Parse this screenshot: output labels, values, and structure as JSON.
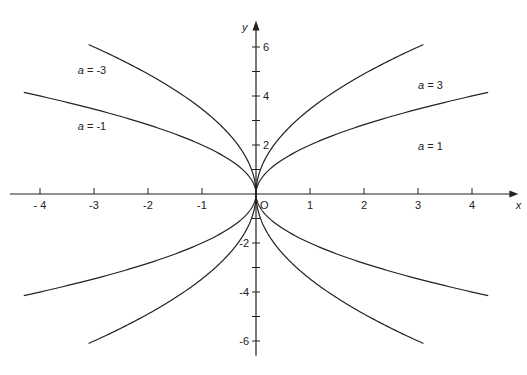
{
  "chart_data": {
    "type": "line",
    "title": "",
    "xlabel": "x",
    "ylabel": "y",
    "origin_label": "O",
    "xlim": [
      -4.5,
      4.6
    ],
    "ylim": [
      -6.6,
      7.0
    ],
    "grid": false,
    "x_ticks": [
      -4,
      -3,
      -2,
      -1,
      1,
      2,
      3,
      4
    ],
    "x_tick_labels": [
      "- 4",
      "-3",
      "-2",
      "-1",
      "1",
      "2",
      "3",
      "4"
    ],
    "y_ticks": [
      -6,
      -5,
      -4,
      -3,
      -2,
      -1,
      1,
      2,
      3,
      4,
      5,
      6
    ],
    "y_tick_labels": {
      "6": "6",
      "4": "4",
      "2": "2",
      "-2": "-2",
      "-4": "-4",
      "-6": "-6"
    },
    "equation": "y^2 = 4ax",
    "series": [
      {
        "name": "a = 3",
        "a": 3,
        "x_range": [
          0,
          3.1
        ],
        "label_pos": [
          3.0,
          4.3
        ]
      },
      {
        "name": "a = 1",
        "a": 1,
        "x_range": [
          0,
          4.3
        ],
        "label_pos": [
          3.0,
          1.8
        ]
      },
      {
        "name": "a = -3",
        "a": -3,
        "x_range": [
          -3.1,
          0
        ],
        "label_pos": [
          -3.3,
          4.9
        ]
      },
      {
        "name": "a = -1",
        "a": -1,
        "x_range": [
          -4.3,
          0
        ],
        "label_pos": [
          -3.3,
          2.6
        ]
      }
    ]
  },
  "layout": {
    "origin_px": [
      256,
      194
    ],
    "x_unit_px": 54,
    "y_unit_px": 24.5,
    "line_color": "#222222"
  }
}
